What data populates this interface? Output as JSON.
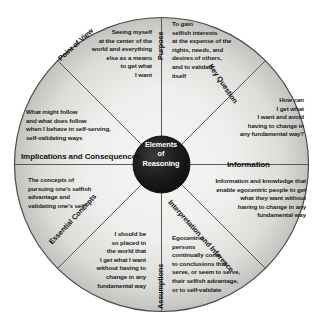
{
  "diagram": {
    "title": "Elements of Reasoning",
    "hub": {
      "line1": "Elements",
      "line2": "of",
      "line3": "Reasoning"
    },
    "colors": {
      "hub_fill": "#1a1a1a",
      "hub_text": "#ffffff",
      "segment_fill_inner": "#f4f4f2",
      "segment_fill_outer": "#c9c9c6",
      "stroke": "#3a3a3a",
      "text": "#1b1b1b",
      "background": "#ffffff"
    },
    "segments": [
      {
        "id": "purpose",
        "label": "Purpose",
        "body": "To gain\nselfish interests\nat the expense of the\nrights, needs, and\ndesires of others,\nand to validate\nitself"
      },
      {
        "id": "key_question",
        "label": "Key Question",
        "body": "How can\nI get what\nI want and avoid\nhaving to change in\nany fundamental way?"
      },
      {
        "id": "information",
        "label": "Information",
        "body": "Information and knowledge that\nenable egocentric people to get\nwhat they want without\nhaving to change in any\nfundamental way"
      },
      {
        "id": "interpretation_and_inference",
        "label": "Interpretation and Inference",
        "body": "Egocentric\npersons\ncontinually come\nto conclusions that\nserve, or seem to serve,\ntheir selfish advantage,\nor to self-validate"
      },
      {
        "id": "assumptions",
        "label": "Assumptions",
        "body": "I should be\nso placed in\nthe world that\nI get what I want\nwithout having to\nchange in any\nfundamental way"
      },
      {
        "id": "essential_concepts",
        "label": "Essential Concepts",
        "body": "The concepts of\npursuing one's selfish\nadvantage and\nvalidating one's self"
      },
      {
        "id": "implications_and_consequences",
        "label": "Implications and Consequences",
        "body": "What might follow\nand what does follow\nwhen I behave in self-serving,\nself-validating ways"
      },
      {
        "id": "point_of_view",
        "label": "Point of View",
        "body": "Seeing myself\nat the center of the\nworld and everything\nelse as a means\nto get what\nI want"
      }
    ]
  }
}
